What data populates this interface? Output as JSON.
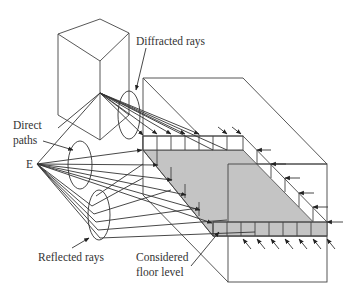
{
  "figure": {
    "labels": {
      "diffracted": "Diffracted rays",
      "direct_line1": "Direct",
      "direct_line2": "paths",
      "emitter": "E",
      "reflected": "Reflected rays",
      "floor_line1": "Considered",
      "floor_line2": "floor level"
    },
    "colors": {
      "line": "#333333",
      "slab_fill": "#c4c4c4",
      "background": "#ffffff"
    }
  }
}
